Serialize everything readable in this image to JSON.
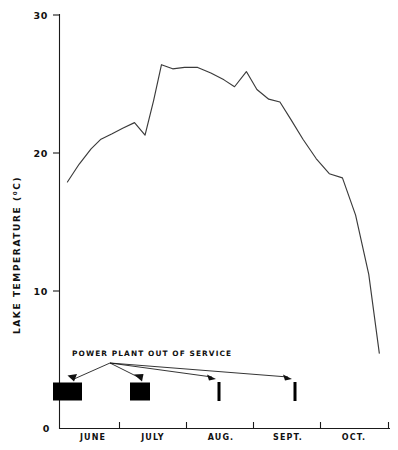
{
  "chart_data": {
    "type": "line",
    "title": "",
    "xlabel": "",
    "ylabel": "LAKE TEMPERATURE (⁰C)",
    "ylim": [
      0,
      30
    ],
    "yticks": [
      0,
      10,
      20,
      30
    ],
    "ytick_labels": [
      "0",
      "10",
      "20",
      "30"
    ],
    "grid": false,
    "legend": "none",
    "x_axis_type": "time",
    "x_categories": [
      "JUNE",
      "JULY",
      "AUG.",
      "SEPT.",
      "OCT."
    ],
    "x_tick_count": 6,
    "series": [
      {
        "name": "Lake temperature",
        "units": "°C",
        "x": [
          0.12,
          0.3,
          0.48,
          0.63,
          0.8,
          0.96,
          1.14,
          1.3,
          1.43,
          1.55,
          1.72,
          1.9,
          2.1,
          2.3,
          2.5,
          2.66,
          2.84,
          3.0,
          3.18,
          3.35,
          3.52,
          3.7,
          3.9,
          4.1,
          4.3,
          4.5,
          4.7,
          4.86
        ],
        "values": [
          17.9,
          19.2,
          20.3,
          21.0,
          21.4,
          21.8,
          22.2,
          21.3,
          23.8,
          26.4,
          26.1,
          26.2,
          26.2,
          25.8,
          25.3,
          24.8,
          25.9,
          24.6,
          23.9,
          23.7,
          22.4,
          21.0,
          19.6,
          18.5,
          18.2,
          15.5,
          11.2,
          5.5
        ]
      }
    ],
    "annotations": [
      {
        "label": "POWER PLANT OUT OF SERVICE",
        "events": [
          {
            "name": "outage-1",
            "start_month": "JUNE",
            "duration": "long",
            "marker": "wide-bar"
          },
          {
            "name": "outage-2",
            "start_month": "JULY",
            "duration": "medium",
            "marker": "wide-bar"
          },
          {
            "name": "outage-3",
            "start_month": "AUG.",
            "duration": "brief",
            "marker": "thin-bar"
          },
          {
            "name": "outage-4",
            "start_month": "SEPT.",
            "duration": "brief",
            "marker": "thin-bar"
          }
        ]
      }
    ],
    "colors": {
      "line": "#3b3b3b",
      "axis": "#1a1a1a",
      "event_marker": "#000000",
      "background": "#ffffff"
    }
  },
  "axes": {
    "y_title": "LAKE TEMPERATURE (⁰C)",
    "y_tick_30": "30",
    "y_tick_20": "20",
    "y_tick_10": "10",
    "y_tick_0": "0"
  },
  "months": {
    "m1": "JUNE",
    "m2": "JULY",
    "m3": "AUG.",
    "m4": "SEPT.",
    "m5": "OCT."
  },
  "annotation": {
    "caption": "POWER PLANT OUT OF SERVICE"
  }
}
